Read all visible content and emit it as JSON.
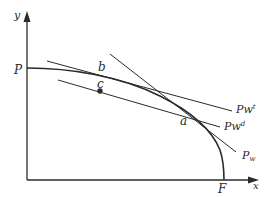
{
  "diagram": {
    "type": "production-possibility-frontier",
    "axes": {
      "y_label": "y",
      "x_label": "x"
    },
    "intercepts": {
      "y_intercept_label": "P",
      "x_intercept_label": "F"
    },
    "points": {
      "b": "b",
      "c": "c",
      "a": "a"
    },
    "lines": [
      {
        "id": "pwt",
        "base": "Pw",
        "sup": "t",
        "sub": ""
      },
      {
        "id": "pwd",
        "base": "Pw",
        "sup": "d",
        "sub": ""
      },
      {
        "id": "pw",
        "base": "P",
        "sup": "",
        "sub": "w"
      }
    ],
    "colors": {
      "ink": "#2a2a2a",
      "background": "#ffffff"
    }
  }
}
